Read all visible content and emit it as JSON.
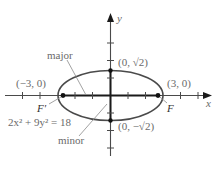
{
  "diagram": {
    "equation": "2x² + 9y² = 18",
    "axes": {
      "x_label": "x",
      "y_label": "y"
    },
    "labels": {
      "major": "major",
      "minor": "minor",
      "left_vertex": "(−3, 0)",
      "right_vertex": "(3, 0)",
      "top_covertex": "(0, √2)",
      "bottom_covertex": "(0, −√2)",
      "focus_left": "F′",
      "focus_right": "F"
    },
    "ellipse": {
      "a": 3,
      "b": 1.4142,
      "foci_x": [
        -2.6458,
        2.6458
      ]
    },
    "colors": {
      "curve": "#4a4a4a",
      "axis_bold": "#1a1a1a",
      "text": "#6a6a6a"
    }
  }
}
